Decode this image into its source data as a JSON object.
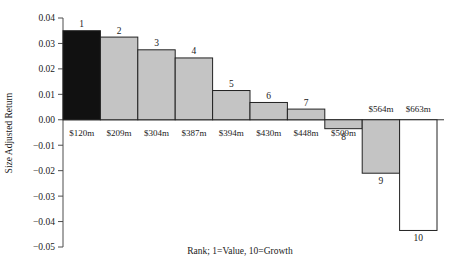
{
  "chart_data": {
    "type": "bar",
    "title": "",
    "xlabel": "Rank; 1=Value, 10=Growth",
    "ylabel": "Size Adjusted Return",
    "categories": [
      "1",
      "2",
      "3",
      "4",
      "5",
      "6",
      "7",
      "8",
      "9",
      "10"
    ],
    "values": [
      0.035,
      0.0325,
      0.0275,
      0.0243,
      0.0115,
      0.0068,
      0.0042,
      -0.0035,
      -0.021,
      -0.0435
    ],
    "point_labels": [
      "$120m",
      "$209m",
      "$304m",
      "$387m",
      "$394m",
      "$430m",
      "$448m",
      "$509m",
      "$564m",
      "$663m"
    ],
    "bar_colors": [
      "#111111",
      "#c4c4c4",
      "#c4c4c4",
      "#c4c4c4",
      "#c4c4c4",
      "#c4c4c4",
      "#c4c4c4",
      "#c4c4c4",
      "#c4c4c4",
      "#ffffff"
    ],
    "ylim": [
      -0.05,
      0.04
    ],
    "ytick_labels": [
      "0.04",
      "0.03",
      "0.02",
      "0.01",
      "0.00",
      "−0.01",
      "−0.02",
      "−0.03",
      "−0.04",
      "−0.05"
    ],
    "ytick_values": [
      0.04,
      0.03,
      0.02,
      0.01,
      0.0,
      -0.01,
      -0.02,
      -0.03,
      -0.04,
      -0.05
    ],
    "grid": false,
    "legend": "none"
  },
  "axes": {
    "y_axis_label": "Size Adjusted Return",
    "x_axis_caption": "Rank; 1=Value, 10=Growth"
  },
  "colors": {
    "bar_gray": "#c4c4c4",
    "bar_black": "#111111",
    "bar_white": "#ffffff",
    "bar_edge": "#222222",
    "axis": "#4d4d4d",
    "background": "#ffffff",
    "text": "#1a1a1a"
  }
}
